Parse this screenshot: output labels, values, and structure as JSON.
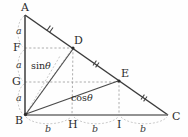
{
  "figure": {
    "canvas": {
      "width": 188,
      "height": 137,
      "background": "#fefefe"
    },
    "colors": {
      "solid_stroke": "#3c3c3c",
      "dashed_stroke": "#9a9a9a",
      "thin_stroke": "#8a8a8a",
      "text": "#2b2b2b",
      "baseline": "#6e6e6e"
    },
    "vertices": [
      {
        "id": "A",
        "label": "A",
        "x": 25,
        "y": 15,
        "label_x": 21,
        "label_y": 2,
        "dot": false
      },
      {
        "id": "B",
        "label": "B",
        "x": 25,
        "y": 115,
        "label_x": 15,
        "label_y": 115,
        "dot": true
      },
      {
        "id": "C",
        "label": "C",
        "x": 168,
        "y": 115,
        "label_x": 172,
        "label_y": 111,
        "dot": false
      },
      {
        "id": "D",
        "label": "D",
        "x": 73,
        "y": 48,
        "label_x": 74,
        "label_y": 35,
        "dot": true
      },
      {
        "id": "E",
        "label": "E",
        "x": 119,
        "y": 81,
        "label_x": 121,
        "label_y": 68,
        "dot": true
      },
      {
        "id": "F",
        "label": "F",
        "x": 25,
        "y": 48,
        "label_x": 13,
        "label_y": 42,
        "dot": false
      },
      {
        "id": "G",
        "label": "G",
        "x": 25,
        "y": 82,
        "label_x": 12,
        "label_y": 76,
        "dot": false
      },
      {
        "id": "H",
        "label": "H",
        "x": 72,
        "y": 115,
        "label_x": 68,
        "label_y": 119,
        "dot": false
      },
      {
        "id": "I",
        "label": "I",
        "x": 119,
        "y": 115,
        "label_x": 117,
        "label_y": 119,
        "dot": false
      }
    ],
    "solid_segments": [
      {
        "name": "side-AB",
        "x1": 25,
        "y1": 15,
        "x2": 25,
        "y2": 115
      },
      {
        "name": "side-AC",
        "x1": 25,
        "y1": 15,
        "x2": 168,
        "y2": 115
      },
      {
        "name": "side-BC",
        "x1": 25,
        "y1": 115,
        "x2": 168,
        "y2": 115
      },
      {
        "name": "segment-BD",
        "x1": 25,
        "y1": 115,
        "x2": 73,
        "y2": 48
      },
      {
        "name": "segment-BE",
        "x1": 25,
        "y1": 115,
        "x2": 119,
        "y2": 81
      }
    ],
    "dashed_segments": [
      {
        "name": "guide-FD",
        "x1": 25,
        "y1": 48,
        "x2": 73,
        "y2": 48
      },
      {
        "name": "guide-GE",
        "x1": 25,
        "y1": 82,
        "x2": 119,
        "y2": 82
      },
      {
        "name": "guide-DH",
        "x1": 73,
        "y1": 48,
        "x2": 72,
        "y2": 115
      },
      {
        "name": "guide-EI",
        "x1": 119,
        "y1": 81,
        "x2": 119,
        "y2": 115
      },
      {
        "name": "guide-BF-ray",
        "x1": 25,
        "y1": 115,
        "x2": 60,
        "y2": 56
      },
      {
        "name": "guide-BG-ray",
        "x1": 25,
        "y1": 115,
        "x2": 72,
        "y2": 49
      }
    ],
    "tick_marks": [
      {
        "name": "tick-AD",
        "x": 50,
        "y": 29,
        "angle": 35
      },
      {
        "name": "tick-DE",
        "x": 96,
        "y": 64,
        "angle": 35
      },
      {
        "name": "tick-EC",
        "x": 144,
        "y": 98,
        "angle": 35
      }
    ],
    "vertical_braces": [
      {
        "name": "brace-a-AF",
        "label": "a",
        "x": 17,
        "y_top": 15,
        "y_bottom": 48,
        "label_x": 16,
        "label_y": 26
      },
      {
        "name": "brace-a-FG",
        "label": "a",
        "x": 17,
        "y_top": 48,
        "y_bottom": 82,
        "label_x": 16,
        "label_y": 60
      },
      {
        "name": "brace-a-GB",
        "label": "a",
        "x": 17,
        "y_top": 82,
        "y_bottom": 115,
        "label_x": 16,
        "label_y": 93
      }
    ],
    "horizontal_braces": [
      {
        "name": "brace-b-BH",
        "label": "b",
        "y": 124,
        "x_left": 25,
        "x_right": 72,
        "label_x": 45,
        "label_y": 124
      },
      {
        "name": "brace-b-HI",
        "label": "b",
        "y": 124,
        "x_left": 72,
        "x_right": 119,
        "label_x": 92,
        "label_y": 124
      },
      {
        "name": "brace-b-IC",
        "label": "b",
        "y": 124,
        "x_left": 119,
        "x_right": 168,
        "label_x": 140,
        "label_y": 124
      }
    ],
    "trig_labels": [
      {
        "name": "sin-theta-label",
        "text": "sin",
        "symbol": "θ",
        "x": 31,
        "y": 61
      },
      {
        "name": "cos-theta-label",
        "text": "cos",
        "symbol": "θ",
        "x": 71,
        "y": 93
      }
    ]
  }
}
